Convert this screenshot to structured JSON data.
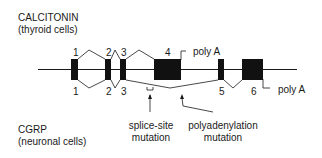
{
  "calcitonin": {
    "title": "CALCITONIN",
    "subtitle": "(thyroid cells)"
  },
  "cgrp": {
    "title": "CGRP",
    "subtitle": "(neuronal cells)"
  },
  "exons_top": [
    "1",
    "2",
    "3",
    "4"
  ],
  "exons_bottom": [
    "1",
    "2",
    "3",
    "5",
    "6"
  ],
  "poly_a_top": "poly A",
  "poly_a_bottom": "poly A",
  "mutations": {
    "splice_site_line1": "splice-site",
    "splice_site_line2": "mutation",
    "polyadenylation_line1": "polyadenylation",
    "polyadenylation_line2": "mutation"
  },
  "colors": {
    "ink": "#1a1a1a",
    "background": "#ffffff"
  }
}
